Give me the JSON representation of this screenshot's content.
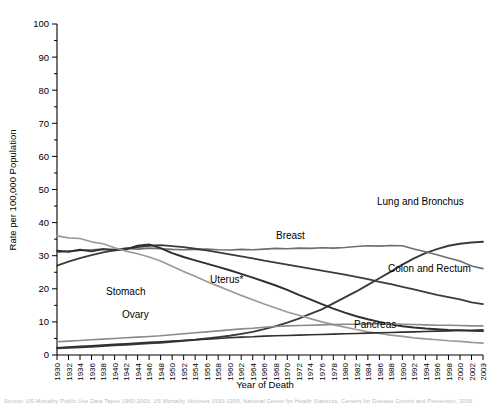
{
  "chart_data": {
    "type": "line",
    "title": "",
    "xlabel": "Year of Death",
    "ylabel": "Rate per 100,000 Population",
    "xlim": [
      1930,
      2003
    ],
    "ylim": [
      0,
      100
    ],
    "ytick_step": 10,
    "yticks": [
      0,
      10,
      20,
      30,
      40,
      50,
      60,
      70,
      80,
      90,
      100
    ],
    "grid": false,
    "legend_position": "inline-annotations",
    "x": [
      1930,
      1932,
      1934,
      1936,
      1938,
      1940,
      1942,
      1944,
      1946,
      1948,
      1950,
      1952,
      1954,
      1956,
      1958,
      1960,
      1962,
      1964,
      1966,
      1968,
      1970,
      1972,
      1974,
      1976,
      1978,
      1980,
      1982,
      1984,
      1986,
      1988,
      1990,
      1992,
      1994,
      1996,
      1998,
      2000,
      2002,
      2003
    ],
    "xticks": [
      "1930",
      "1932",
      "1934",
      "1936",
      "1938",
      "1940",
      "1942",
      "1944",
      "1946",
      "1948",
      "1950",
      "1952",
      "1954",
      "1956",
      "1958",
      "1960",
      "1962",
      "1964",
      "1966",
      "1968",
      "1970",
      "1972",
      "1974",
      "1976",
      "1978",
      "1980",
      "1982",
      "1984",
      "1986",
      "1988",
      "1990",
      "1992",
      "1994",
      "1996",
      "1998",
      "2000",
      "2002",
      "2003"
    ],
    "series": [
      {
        "name": "Lung and Bronchus",
        "label": "Lung and Bronchus",
        "color": "#3b3b3b",
        "width": 1.9,
        "label_x": 377,
        "label_y": 205,
        "values": [
          2.0,
          2.2,
          2.3,
          2.5,
          2.7,
          2.9,
          3.1,
          3.3,
          3.5,
          3.7,
          4.0,
          4.3,
          4.6,
          5.0,
          5.4,
          5.8,
          6.4,
          7.0,
          7.8,
          8.7,
          9.8,
          11.0,
          12.4,
          13.8,
          15.6,
          17.4,
          19.2,
          21.2,
          23.2,
          25.2,
          27.3,
          29.2,
          30.8,
          32.0,
          33.0,
          33.6,
          34.0,
          34.2
        ]
      },
      {
        "name": "Breast",
        "label": "Breast",
        "color": "#6e6e6e",
        "width": 1.6,
        "label_x": 276,
        "label_y": 239,
        "values": [
          31.0,
          31.4,
          31.6,
          31.8,
          32.0,
          31.9,
          32.2,
          32.0,
          32.3,
          32.1,
          31.9,
          31.8,
          31.9,
          32.0,
          31.8,
          31.7,
          31.9,
          31.8,
          32.0,
          32.2,
          32.1,
          32.3,
          32.2,
          32.4,
          32.3,
          32.5,
          32.8,
          33.0,
          32.9,
          33.1,
          33.0,
          32.0,
          31.2,
          30.3,
          29.3,
          28.4,
          26.9,
          26.1
        ]
      },
      {
        "name": "Colon and Rectum",
        "label": "Colon and Rectum",
        "color": "#3b3b3b",
        "width": 1.8,
        "label_x": 388,
        "label_y": 272,
        "values": [
          27.0,
          28.2,
          29.3,
          30.2,
          31.0,
          31.6,
          32.2,
          32.6,
          33.0,
          33.2,
          32.9,
          32.6,
          32.1,
          31.6,
          31.0,
          30.4,
          29.8,
          29.2,
          28.5,
          27.9,
          27.3,
          26.7,
          26.1,
          25.5,
          24.9,
          24.3,
          23.6,
          22.9,
          22.1,
          21.4,
          20.6,
          19.8,
          19.0,
          18.2,
          17.5,
          16.8,
          15.9,
          15.4
        ]
      },
      {
        "name": "Uterus*",
        "label": "Uterus*",
        "color": "#2f2f2f",
        "width": 1.9,
        "label_x": 210,
        "label_y": 283,
        "values": [
          31.5,
          31.2,
          31.8,
          31.3,
          32.0,
          31.6,
          31.9,
          33.0,
          33.4,
          32.3,
          30.8,
          29.6,
          28.6,
          27.6,
          26.6,
          25.6,
          24.5,
          23.4,
          22.2,
          21.0,
          19.7,
          18.2,
          16.8,
          15.4,
          14.0,
          12.8,
          11.7,
          10.8,
          10.0,
          9.3,
          8.7,
          8.3,
          8.0,
          7.8,
          7.6,
          7.5,
          7.3,
          7.2
        ]
      },
      {
        "name": "Stomach",
        "label": "Stomach",
        "color": "#9a9a9a",
        "width": 1.7,
        "label_x": 106,
        "label_y": 295,
        "values": [
          36.0,
          35.4,
          35.2,
          34.2,
          33.6,
          32.4,
          31.4,
          30.6,
          29.6,
          28.4,
          26.8,
          25.2,
          23.8,
          22.2,
          20.8,
          19.4,
          18.0,
          16.7,
          15.4,
          14.2,
          13.0,
          12.0,
          11.0,
          10.0,
          9.2,
          8.4,
          7.7,
          7.0,
          6.5,
          6.0,
          5.6,
          5.2,
          4.9,
          4.6,
          4.3,
          4.1,
          3.8,
          3.6
        ]
      },
      {
        "name": "Ovary",
        "label": "Ovary",
        "color": "#8a8a8a",
        "width": 1.6,
        "label_x": 122,
        "label_y": 318,
        "values": [
          4.0,
          4.2,
          4.4,
          4.6,
          4.8,
          5.0,
          5.2,
          5.4,
          5.6,
          5.8,
          6.1,
          6.4,
          6.7,
          7.0,
          7.3,
          7.6,
          7.9,
          8.1,
          8.4,
          8.6,
          8.8,
          8.9,
          9.0,
          9.1,
          9.2,
          9.3,
          9.3,
          9.4,
          9.4,
          9.4,
          9.3,
          9.2,
          9.1,
          9.0,
          9.0,
          8.9,
          8.8,
          8.8
        ]
      },
      {
        "name": "Pancreas",
        "label": "Pancreas",
        "color": "#2f2f2f",
        "width": 1.6,
        "label_x": 354,
        "label_y": 328,
        "values": [
          2.2,
          2.4,
          2.6,
          2.8,
          3.0,
          3.2,
          3.4,
          3.6,
          3.8,
          4.0,
          4.2,
          4.4,
          4.6,
          4.8,
          5.0,
          5.2,
          5.4,
          5.5,
          5.7,
          5.8,
          5.9,
          6.0,
          6.1,
          6.2,
          6.3,
          6.4,
          6.5,
          6.6,
          6.7,
          6.8,
          6.9,
          7.0,
          7.1,
          7.2,
          7.3,
          7.4,
          7.5,
          7.6
        ]
      }
    ]
  },
  "footnote": "Source: US Mortality Public Use Data Tapes 1960-2003, US Mortality Volumes 1930-1959, National Center for Health Statistics, Centers for Disease Control and Prevention, 2006."
}
